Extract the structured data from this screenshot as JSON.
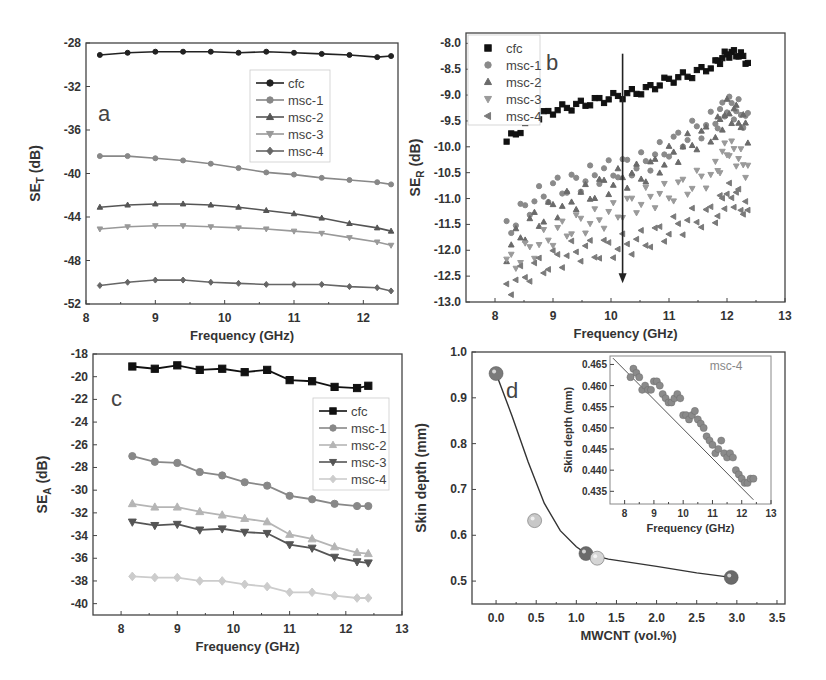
{
  "chart_data": [
    {
      "id": "a",
      "type": "line",
      "panel_label": "a",
      "title": "",
      "xlabel": "Frequency (GHz)",
      "ylabel": "SE_T (dB)",
      "ylabel_main": "SE",
      "ylabel_sub": "T",
      "ylabel_unit": " (dB)",
      "xlim": [
        8,
        12.5
      ],
      "ylim": [
        -52,
        -28
      ],
      "xticks": [
        8,
        9,
        10,
        11,
        12
      ],
      "yticks": [
        -52,
        -48,
        -44,
        -40,
        -36,
        -32,
        -28
      ],
      "legend_position": "upper-right-inner",
      "box": {
        "x": 86,
        "y": 43,
        "w": 312,
        "h": 261
      },
      "x": [
        8.2,
        8.6,
        9.0,
        9.4,
        9.8,
        10.2,
        10.6,
        11.0,
        11.4,
        11.8,
        12.2,
        12.4
      ],
      "series": [
        {
          "name": "cfc",
          "marker": "circle",
          "color": "#222222",
          "values": [
            -29.1,
            -28.9,
            -28.8,
            -28.8,
            -28.8,
            -28.9,
            -28.8,
            -28.9,
            -29.0,
            -29.1,
            -29.3,
            -29.2
          ]
        },
        {
          "name": "msc-1",
          "marker": "circle",
          "color": "#888888",
          "values": [
            -38.4,
            -38.4,
            -38.6,
            -38.8,
            -39.1,
            -39.5,
            -39.9,
            -40.1,
            -40.4,
            -40.6,
            -40.8,
            -41.0
          ]
        },
        {
          "name": "msc-2",
          "marker": "triangle-up",
          "color": "#555555",
          "values": [
            -43.1,
            -42.9,
            -42.8,
            -42.8,
            -42.9,
            -43.1,
            -43.4,
            -43.7,
            -44.1,
            -44.6,
            -45.0,
            -45.3
          ]
        },
        {
          "name": "msc-3",
          "marker": "triangle-down",
          "color": "#999999",
          "values": [
            -45.1,
            -44.9,
            -44.8,
            -44.8,
            -44.9,
            -45.0,
            -45.1,
            -45.3,
            -45.5,
            -45.9,
            -46.3,
            -46.6
          ]
        },
        {
          "name": "msc-4",
          "marker": "diamond",
          "color": "#666666",
          "values": [
            -50.3,
            -50.0,
            -49.8,
            -49.8,
            -50.0,
            -50.1,
            -50.2,
            -50.2,
            -50.2,
            -50.4,
            -50.5,
            -50.8
          ]
        }
      ]
    },
    {
      "id": "b",
      "type": "scatter",
      "panel_label": "b",
      "title": "",
      "xlabel": "Frequency (GHz)",
      "ylabel": "SE_R (dB)",
      "ylabel_main": "SE",
      "ylabel_sub": "R",
      "ylabel_unit": " (dB)",
      "xlim": [
        7.5,
        13
      ],
      "ylim": [
        -13.0,
        -7.8
      ],
      "xticks": [
        8,
        9,
        10,
        11,
        12,
        13
      ],
      "yticks": [
        -13.0,
        -12.5,
        -12.0,
        -11.5,
        -11.0,
        -10.5,
        -10.0,
        -9.5,
        -9.0,
        -8.5,
        -8.0
      ],
      "ytick_labels": [
        "-13.0",
        "-12.5",
        "-12.0",
        "-11.5",
        "-11.0",
        "-10.5",
        "-10.0",
        "-9.5",
        "-9.0",
        "-8.5",
        "-8.0"
      ],
      "legend_position": "upper-left-inner",
      "annotation": {
        "type": "arrow-down",
        "x": 10.2,
        "y_from": -8.2,
        "y_to": -12.6
      },
      "box": {
        "x": 466,
        "y": 33,
        "w": 319,
        "h": 269
      },
      "x": [
        8.2,
        8.6,
        9.0,
        9.4,
        9.8,
        10.2,
        10.6,
        11.0,
        11.4,
        11.8,
        12.0,
        12.2,
        12.4
      ],
      "series": [
        {
          "name": "cfc",
          "marker": "square",
          "color": "#111111",
          "values": [
            -9.9,
            -9.5,
            -9.3,
            -9.2,
            -9.1,
            -9.0,
            -8.9,
            -8.7,
            -8.6,
            -8.4,
            -8.2,
            -8.2,
            -8.4
          ]
        },
        {
          "name": "msc-1",
          "marker": "circle",
          "color": "#8a8a8a",
          "values": [
            -11.6,
            -11.1,
            -10.8,
            -10.7,
            -10.5,
            -10.4,
            -10.3,
            -10.0,
            -9.7,
            -9.5,
            -9.2,
            -9.3,
            -9.6
          ]
        },
        {
          "name": "msc-2",
          "marker": "triangle-up",
          "color": "#6a6a6a",
          "values": [
            -12.0,
            -11.5,
            -11.2,
            -11.0,
            -10.8,
            -10.6,
            -10.5,
            -10.2,
            -9.9,
            -9.7,
            -9.3,
            -9.4,
            -9.8
          ]
        },
        {
          "name": "msc-3",
          "marker": "triangle-down",
          "color": "#9a9a9a",
          "values": [
            -12.3,
            -12.0,
            -11.7,
            -11.5,
            -11.4,
            -11.2,
            -11.0,
            -10.9,
            -10.7,
            -10.5,
            -10.0,
            -10.2,
            -10.5
          ]
        },
        {
          "name": "msc-4",
          "marker": "triangle-left",
          "color": "#7a7a7a",
          "values": [
            -12.7,
            -12.4,
            -12.2,
            -12.0,
            -12.0,
            -11.9,
            -11.8,
            -11.6,
            -11.4,
            -11.3,
            -10.9,
            -11.0,
            -11.4
          ]
        }
      ]
    },
    {
      "id": "c",
      "type": "line",
      "panel_label": "c",
      "title": "",
      "xlabel": "Frequency (GHz)",
      "ylabel": "SE_A (dB)",
      "ylabel_main": "SE",
      "ylabel_sub": "A",
      "ylabel_unit": " (dB)",
      "xlim": [
        7.5,
        13
      ],
      "ylim": [
        -41,
        -18
      ],
      "xticks": [
        8,
        9,
        10,
        11,
        12,
        13
      ],
      "yticks": [
        -40,
        -38,
        -36,
        -34,
        -32,
        -30,
        -28,
        -26,
        -24,
        -22,
        -20,
        -18
      ],
      "legend_position": "upper-right-inner",
      "box": {
        "x": 93,
        "y": 354,
        "w": 309,
        "h": 261
      },
      "x": [
        8.2,
        8.6,
        9.0,
        9.4,
        9.8,
        10.2,
        10.6,
        11.0,
        11.4,
        11.8,
        12.2,
        12.4
      ],
      "series": [
        {
          "name": "cfc",
          "marker": "square",
          "color": "#111111",
          "values": [
            -19.1,
            -19.3,
            -19.0,
            -19.4,
            -19.3,
            -19.6,
            -19.4,
            -20.3,
            -20.4,
            -20.9,
            -21.0,
            -20.8
          ]
        },
        {
          "name": "msc-1",
          "marker": "circle",
          "color": "#888888",
          "values": [
            -27.0,
            -27.5,
            -27.6,
            -28.4,
            -28.7,
            -29.3,
            -29.6,
            -30.5,
            -30.8,
            -31.2,
            -31.4,
            -31.4
          ]
        },
        {
          "name": "msc-2",
          "marker": "triangle-up",
          "color": "#b5b5b5",
          "values": [
            -31.2,
            -31.5,
            -31.5,
            -31.9,
            -32.2,
            -32.5,
            -32.8,
            -33.9,
            -34.3,
            -35.0,
            -35.5,
            -35.6
          ]
        },
        {
          "name": "msc-3",
          "marker": "triangle-down",
          "color": "#555555",
          "values": [
            -32.8,
            -33.1,
            -33.0,
            -33.5,
            -33.4,
            -33.7,
            -33.8,
            -34.8,
            -35.1,
            -35.9,
            -36.3,
            -36.4
          ]
        },
        {
          "name": "msc-4",
          "marker": "diamond",
          "color": "#cccccc",
          "values": [
            -37.6,
            -37.7,
            -37.7,
            -38.0,
            -38.0,
            -38.3,
            -38.5,
            -39.0,
            -39.0,
            -39.3,
            -39.5,
            -39.5
          ]
        }
      ]
    },
    {
      "id": "d",
      "type": "scatter",
      "panel_label": "d",
      "title": "",
      "xlabel": "MWCNT (vol.%)",
      "ylabel": "Skin depth (mm)",
      "xlim": [
        -0.3,
        3.6
      ],
      "ylim": [
        0.45,
        1.0
      ],
      "xticks": [
        0.0,
        0.5,
        1.0,
        1.5,
        2.0,
        2.5,
        3.0,
        3.5
      ],
      "xtick_labels": [
        "0.0",
        "0.5",
        "1.0",
        "1.5",
        "2.0",
        "2.5",
        "3.0",
        "3.5"
      ],
      "yticks": [
        0.5,
        0.6,
        0.7,
        0.8,
        0.9,
        1.0
      ],
      "ytick_labels": [
        "0.5",
        "0.6",
        "0.7",
        "0.8",
        "0.9",
        "1.0"
      ],
      "box": {
        "x": 472,
        "y": 352,
        "w": 313,
        "h": 252
      },
      "points": [
        {
          "x": 0.0,
          "y": 0.953,
          "color": "#7a7a7a"
        },
        {
          "x": 0.48,
          "y": 0.632,
          "color": "#c8c8c8"
        },
        {
          "x": 1.12,
          "y": 0.56,
          "color": "#6a6a6a"
        },
        {
          "x": 1.26,
          "y": 0.55,
          "color": "#d5d5d5"
        },
        {
          "x": 2.93,
          "y": 0.508,
          "color": "#6a6a6a"
        }
      ],
      "fit_curve": [
        [
          0.0,
          0.953
        ],
        [
          0.2,
          0.86
        ],
        [
          0.4,
          0.76
        ],
        [
          0.6,
          0.67
        ],
        [
          0.8,
          0.61
        ],
        [
          1.0,
          0.575
        ],
        [
          1.12,
          0.56
        ],
        [
          1.4,
          0.548
        ],
        [
          2.0,
          0.532
        ],
        [
          2.5,
          0.518
        ],
        [
          2.93,
          0.508
        ]
      ],
      "inset": {
        "type": "scatter",
        "title": "msc-4",
        "xlabel": "Frequency (GHz)",
        "ylabel": "Skin depth (mm)",
        "xlim": [
          7.5,
          13
        ],
        "ylim": [
          0.432,
          0.467
        ],
        "xticks": [
          8,
          9,
          10,
          11,
          12,
          13
        ],
        "yticks": [
          0.435,
          0.44,
          0.445,
          0.45,
          0.455,
          0.46,
          0.465
        ],
        "ytick_labels": [
          "0.435",
          "0.440",
          "0.445",
          "0.450",
          "0.455",
          "0.460",
          "0.465"
        ],
        "box": {
          "x": 610,
          "y": 356,
          "w": 161,
          "h": 148
        },
        "x": [
          8.2,
          8.3,
          8.4,
          8.5,
          8.6,
          8.7,
          8.8,
          8.9,
          9.0,
          9.1,
          9.2,
          9.3,
          9.4,
          9.5,
          9.6,
          9.7,
          9.8,
          9.9,
          10.0,
          10.1,
          10.2,
          10.3,
          10.4,
          10.5,
          10.6,
          10.7,
          10.8,
          10.9,
          11.0,
          11.1,
          11.2,
          11.3,
          11.4,
          11.5,
          11.6,
          11.7,
          11.8,
          11.9,
          12.0,
          12.1,
          12.2,
          12.3,
          12.4
        ],
        "values": [
          0.462,
          0.464,
          0.463,
          0.462,
          0.459,
          0.46,
          0.459,
          0.459,
          0.461,
          0.461,
          0.46,
          0.458,
          0.457,
          0.456,
          0.456,
          0.457,
          0.458,
          0.457,
          0.453,
          0.453,
          0.452,
          0.453,
          0.454,
          0.452,
          0.451,
          0.45,
          0.448,
          0.447,
          0.446,
          0.444,
          0.445,
          0.447,
          0.444,
          0.443,
          0.444,
          0.443,
          0.44,
          0.439,
          0.438,
          0.437,
          0.437,
          0.438,
          0.438
        ],
        "fit_line": [
          [
            7.6,
            0.4665
          ],
          [
            12.4,
            0.433
          ]
        ],
        "point_color": "#8a8a8a"
      }
    }
  ]
}
